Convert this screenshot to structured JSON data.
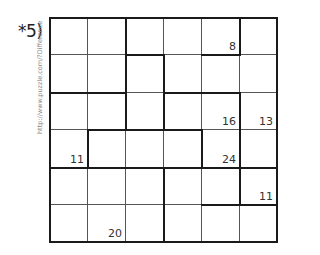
{
  "puzzle": {
    "label": "*5)",
    "watermark": "http://www.puzzle.com/?Difference",
    "rows": 6,
    "cols": 6,
    "clues": [
      {
        "row": 0,
        "col": 4,
        "value": "8"
      },
      {
        "row": 2,
        "col": 4,
        "value": "16"
      },
      {
        "row": 2,
        "col": 5,
        "value": "13"
      },
      {
        "row": 3,
        "col": 0,
        "value": "11"
      },
      {
        "row": 3,
        "col": 4,
        "value": "24"
      },
      {
        "row": 4,
        "col": 5,
        "value": "11"
      },
      {
        "row": 5,
        "col": 1,
        "value": "20"
      }
    ]
  }
}
